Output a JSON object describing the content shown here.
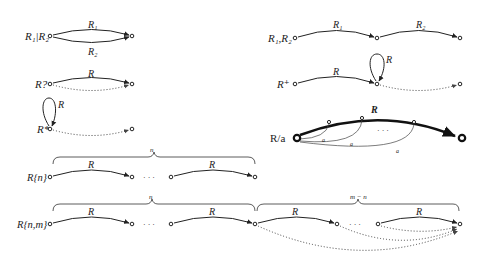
{
  "diagram": {
    "constructs": {
      "alternation": {
        "label": "R₁|R₂",
        "top_edge": "R₁",
        "bottom_edge": "R₂"
      },
      "optional": {
        "label": "R?",
        "edge": "R"
      },
      "star": {
        "label": "R*",
        "loop": "R"
      },
      "concatenation": {
        "label": "R₁,R₂",
        "edge1": "R₁",
        "edge2": "R₂"
      },
      "plus": {
        "label": "R⁺",
        "edge": "R",
        "loop": "R"
      },
      "suffix": {
        "label": "R/a",
        "edge": "R",
        "sub_edges": [
          "a",
          "a",
          "a"
        ],
        "ellipsis": "· · ·"
      },
      "repeat_n": {
        "label": "R{n}",
        "brace": "n",
        "edge1": "R",
        "edge2": "R",
        "ellipsis": "· · ·"
      },
      "repeat_nm": {
        "label": "R{n,m}",
        "brace1": "n",
        "brace2": "m − n",
        "edges": [
          "R",
          "R",
          "R",
          "R"
        ],
        "ellipsis1": "· · ·",
        "ellipsis2": "· · ·"
      }
    }
  }
}
